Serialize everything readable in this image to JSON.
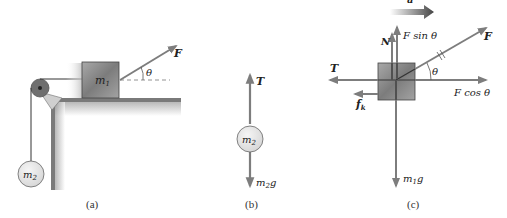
{
  "panels": {
    "a": {
      "caption": "(a)",
      "block_label": "m",
      "block_sub": "1",
      "hanging_label": "m",
      "hanging_sub": "2",
      "force_label": "F",
      "angle_label": "θ"
    },
    "b": {
      "caption": "(b)",
      "mass_label": "m",
      "mass_sub": "2",
      "up_force": "T",
      "down_force_m": "m",
      "down_force_sub": "2",
      "down_force_g": "g"
    },
    "c": {
      "caption": "(c)",
      "accel_label": "a",
      "normal_label": "N",
      "fsin_label_f": "F",
      "fsin_label_rest": " sin  θ",
      "force_label": "F",
      "angle_label": "θ",
      "tension_label": "T",
      "friction_label": "f",
      "friction_sub": "k",
      "fcos_label_f": "F",
      "fcos_label_rest": " cos  θ",
      "weight_m": "m",
      "weight_sub": "1",
      "weight_g": "g"
    }
  },
  "colors": {
    "arrow": "#7d7d7d",
    "block": "#8f8f8f",
    "mass_fill": "#e4e4e4",
    "surface": "#6e6e6e",
    "accel_arrow": "#444444"
  }
}
